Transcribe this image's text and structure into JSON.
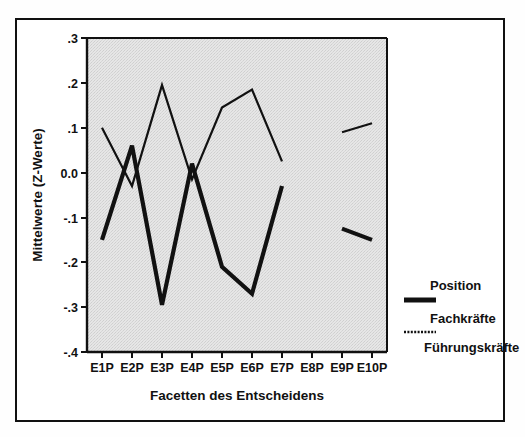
{
  "chart_data": {
    "type": "line",
    "title": "",
    "xlabel": "Facetten des Entscheidens",
    "ylabel": "Mittelwerte (Z-Werte)",
    "categories": [
      "E1P",
      "E2P",
      "E3P",
      "E4P",
      "E5P",
      "E6P",
      "E7P",
      "E8P",
      "E9P",
      "E10P"
    ],
    "ylim": [
      -0.4,
      0.3
    ],
    "yticks": [
      0.3,
      0.2,
      0.1,
      0.0,
      -0.1,
      -0.2,
      -0.3,
      -0.4
    ],
    "ytick_labels": [
      ".3",
      ".2",
      ".1",
      "0.0",
      "-.1",
      "-.2",
      "-.3",
      "-.4"
    ],
    "grid": false,
    "legend_position": "right",
    "legend_title": "Position",
    "series": [
      {
        "name": "Fachkräfte",
        "style": "solid-thick",
        "color": "#111111",
        "values": [
          -0.15,
          0.06,
          -0.295,
          0.02,
          -0.21,
          -0.27,
          -0.03,
          null,
          -0.125,
          -0.15
        ]
      },
      {
        "name": "Führungskräfte",
        "style": "solid-thin",
        "color": "#111111",
        "values": [
          0.1,
          -0.03,
          0.195,
          -0.015,
          0.145,
          0.185,
          0.025,
          null,
          0.09,
          0.11
        ]
      }
    ]
  },
  "axes": {
    "y_label": "Mittelwerte (Z-Werte)",
    "x_label": "Facetten des Entscheidens",
    "y_ticks": [
      ".3",
      ".2",
      ".1",
      "0.0",
      "-.1",
      "-.2",
      "-.3",
      "-.4"
    ],
    "x_ticks": [
      "E1P",
      "E2P",
      "E3P",
      "E4P",
      "E5P",
      "E6P",
      "E7P",
      "E8P",
      "E9P",
      "E10P"
    ]
  },
  "legend": {
    "title": "Position",
    "entries": [
      {
        "label": "Fachkräfte",
        "swatch": "thick-line-swatch"
      },
      {
        "label": "Führungskräfte",
        "swatch": "dotted-line-swatch"
      }
    ]
  },
  "colors": {
    "plot_background": "#e3e3e3",
    "line": "#111111",
    "frame": "#111111",
    "page_background": "#ffffff"
  }
}
